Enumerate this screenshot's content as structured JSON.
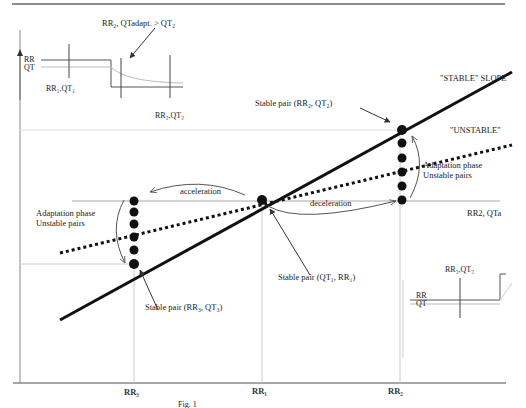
{
  "header": {
    "rule_color": "#555555"
  },
  "inset_top": {
    "title": "RR₂, QTadapt. > QT₂",
    "axis_labels": [
      "RR",
      "QT"
    ],
    "marker_left": "RR₁,QT₁",
    "marker_right": "RR₂,QT₂"
  },
  "inset_bottom": {
    "title": "RR₃,QT₃",
    "axis_labels": [
      "RR",
      "QT"
    ]
  },
  "lines": {
    "stable": "\"STABLE\" SLOPE",
    "unstable": "\"UNSTABLE\""
  },
  "annotations": {
    "stable_pair_top": "Stable pair (RR₂, QT₂)",
    "stable_pair_mid": "Stable pair (QT₁, RR₁)",
    "stable_pair_low": "Stable pair (RR₃, QT₃)",
    "adapt_right_1": "Adaptation phase",
    "adapt_right_2": "Unstable pairs",
    "adapt_left_1": "Adaptation phase",
    "adapt_left_2": "Unstable pairs",
    "acceleration": "acceleration",
    "deceleration": "deceleration",
    "side_label": "RR2, QTa"
  },
  "axes": {
    "y_label_top": "RR",
    "x_ticks": [
      "RR₃",
      "RR₁",
      "RR₂"
    ]
  },
  "caption": "Fig. 1"
}
